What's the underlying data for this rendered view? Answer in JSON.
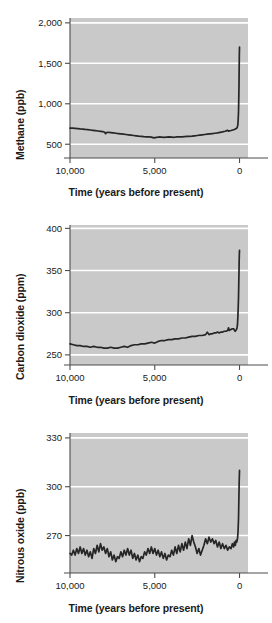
{
  "figure": {
    "title": "",
    "background_color": "#ffffff",
    "plot_background_color": "#c9c9c9",
    "gridline_color": "#ffffff",
    "line_color": "#262626",
    "axis_color": "#4d4d4d",
    "text_color": "#1a1a1a"
  },
  "panels": [
    {
      "id": "methane",
      "ylabel": "Methane (ppb)",
      "xlabel": "Time (years before present)",
      "yticks": [
        "2,000",
        "1,500",
        "1,000",
        "500"
      ],
      "ytick_values": [
        2000,
        1500,
        1000,
        500
      ],
      "xticks": [
        "10,000",
        "5,000",
        "0"
      ],
      "xtick_values": [
        10000,
        5000,
        0
      ]
    },
    {
      "id": "carbon-dioxide",
      "ylabel": "Carbon dioxide (ppm)",
      "xlabel": "Time (years before present)",
      "yticks": [
        "400",
        "350",
        "300",
        "250"
      ],
      "ytick_values": [
        400,
        350,
        300,
        250
      ],
      "xticks": [
        "10,000",
        "5,000",
        "0"
      ],
      "xtick_values": [
        10000,
        5000,
        0
      ]
    },
    {
      "id": "nitrous-oxide",
      "ylabel": "Nitrous oxide (ppb)",
      "xlabel": "Time (years before present)",
      "yticks": [
        "330",
        "300",
        "270"
      ],
      "ytick_values": [
        330,
        300,
        270
      ],
      "xticks": [
        "10,000",
        "5,000",
        "0"
      ],
      "xtick_values": [
        10000,
        5000,
        0
      ]
    }
  ],
  "chart_data": [
    {
      "type": "line",
      "id": "methane",
      "title": "",
      "xlabel": "Time (years before present)",
      "ylabel": "Methane (ppb)",
      "xlim": [
        10000,
        -500
      ],
      "ylim": [
        330,
        2060
      ],
      "xticks": [
        10000,
        5000,
        0
      ],
      "xticklabels": [
        "10,000",
        "5,000",
        "0"
      ],
      "yticks": [
        500,
        1000,
        1500,
        2000
      ],
      "yticklabels": [
        "500",
        "1,000",
        "1,500",
        "2,000"
      ],
      "x_reversed": true,
      "grid": "horizontal-white",
      "legend": "none",
      "series": [
        {
          "name": "Methane concentration",
          "units": "ppb",
          "x": [
            10000,
            9850,
            9700,
            9550,
            9400,
            9250,
            9100,
            8950,
            8800,
            8650,
            8500,
            8350,
            8200,
            8050,
            7950,
            7900,
            7850,
            7750,
            7600,
            7450,
            7300,
            7150,
            7000,
            6850,
            6700,
            6550,
            6400,
            6250,
            6100,
            5950,
            5800,
            5650,
            5500,
            5350,
            5200,
            5050,
            4900,
            4750,
            4600,
            4450,
            4300,
            4150,
            4000,
            3850,
            3700,
            3550,
            3400,
            3250,
            3100,
            2950,
            2800,
            2650,
            2500,
            2350,
            2200,
            2050,
            1900,
            1750,
            1600,
            1450,
            1300,
            1150,
            1000,
            850,
            750,
            700,
            650,
            600,
            500,
            400,
            300,
            250,
            200,
            160,
            130,
            100,
            80,
            60,
            45,
            30,
            20,
            10,
            0
          ],
          "y": [
            700,
            700,
            697,
            694,
            690,
            687,
            683,
            680,
            676,
            672,
            668,
            664,
            660,
            655,
            648,
            630,
            645,
            648,
            644,
            640,
            636,
            632,
            628,
            624,
            620,
            616,
            612,
            608,
            604,
            600,
            597,
            594,
            592,
            590,
            588,
            578,
            584,
            590,
            588,
            586,
            588,
            590,
            588,
            586,
            590,
            592,
            590,
            594,
            596,
            598,
            600,
            604,
            608,
            612,
            616,
            620,
            624,
            628,
            632,
            636,
            640,
            646,
            652,
            660,
            668,
            672,
            662,
            666,
            670,
            676,
            682,
            688,
            694,
            700,
            712,
            740,
            800,
            900,
            1050,
            1250,
            1450,
            1620,
            1700,
            1745
          ]
        }
      ]
    },
    {
      "type": "line",
      "id": "carbon-dioxide",
      "title": "",
      "xlabel": "Time (years before present)",
      "ylabel": "Carbon dioxide (ppm)",
      "xlim": [
        10000,
        -500
      ],
      "ylim": [
        238,
        404
      ],
      "xticks": [
        10000,
        5000,
        0
      ],
      "xticklabels": [
        "10,000",
        "5,000",
        "0"
      ],
      "yticks": [
        250,
        300,
        350,
        400
      ],
      "yticklabels": [
        "250",
        "300",
        "350",
        "400"
      ],
      "x_reversed": true,
      "grid": "horizontal-white",
      "legend": "none",
      "series": [
        {
          "name": "Carbon dioxide concentration",
          "units": "ppm",
          "x": [
            10000,
            9800,
            9600,
            9400,
            9200,
            9000,
            8800,
            8600,
            8400,
            8200,
            8000,
            7800,
            7600,
            7400,
            7200,
            7000,
            6800,
            6600,
            6400,
            6200,
            6000,
            5800,
            5600,
            5400,
            5200,
            5000,
            4800,
            4600,
            4400,
            4200,
            4000,
            3800,
            3600,
            3400,
            3200,
            3000,
            2800,
            2600,
            2400,
            2200,
            2000,
            1900,
            1800,
            1700,
            1600,
            1500,
            1400,
            1300,
            1200,
            1100,
            1000,
            900,
            800,
            700,
            650,
            600,
            550,
            500,
            420,
            350,
            300,
            260,
            220,
            180,
            150,
            120,
            100,
            80,
            60,
            45,
            30,
            20,
            10,
            0
          ],
          "y": [
            263,
            262,
            261,
            261,
            260,
            260,
            259,
            260,
            259,
            259,
            258,
            258,
            259,
            258,
            258,
            259,
            260,
            259,
            261,
            262,
            262,
            263,
            263,
            264,
            265,
            264,
            266,
            267,
            267,
            268,
            268,
            269,
            269,
            270,
            270,
            271,
            272,
            272,
            273,
            273,
            274,
            277,
            274,
            275,
            275,
            276,
            276,
            277,
            276,
            277,
            277,
            278,
            278,
            279,
            282,
            279,
            280,
            280,
            281,
            281,
            279,
            278,
            279,
            280,
            282,
            286,
            294,
            305,
            318,
            334,
            350,
            362,
            370,
            374
          ]
        }
      ]
    },
    {
      "type": "line",
      "id": "nitrous-oxide",
      "title": "",
      "xlabel": "Time (years before present)",
      "ylabel": "Nitrous oxide (ppb)",
      "xlim": [
        10000,
        -500
      ],
      "ylim": [
        247,
        333
      ],
      "xticks": [
        10000,
        5000,
        0
      ],
      "xticklabels": [
        "10,000",
        "5,000",
        "0"
      ],
      "yticks": [
        270,
        300,
        330
      ],
      "yticklabels": [
        "270",
        "300",
        "330"
      ],
      "x_reversed": true,
      "grid": "horizontal-white",
      "legend": "none",
      "series": [
        {
          "name": "Nitrous oxide concentration",
          "units": "ppb",
          "x": [
            10000,
            9900,
            9800,
            9700,
            9600,
            9500,
            9400,
            9300,
            9200,
            9100,
            9000,
            8900,
            8800,
            8700,
            8600,
            8500,
            8400,
            8300,
            8200,
            8100,
            8000,
            7900,
            7800,
            7700,
            7600,
            7500,
            7400,
            7300,
            7200,
            7100,
            7000,
            6900,
            6800,
            6700,
            6600,
            6500,
            6400,
            6300,
            6200,
            6100,
            6000,
            5900,
            5800,
            5700,
            5600,
            5500,
            5400,
            5300,
            5200,
            5100,
            5000,
            4900,
            4800,
            4700,
            4600,
            4500,
            4400,
            4300,
            4200,
            4100,
            4000,
            3900,
            3800,
            3700,
            3600,
            3500,
            3400,
            3300,
            3200,
            3100,
            3000,
            2900,
            2800,
            2700,
            2600,
            2500,
            2400,
            2300,
            2200,
            2100,
            2000,
            1900,
            1800,
            1700,
            1600,
            1500,
            1400,
            1300,
            1200,
            1100,
            1000,
            900,
            800,
            700,
            600,
            500,
            420,
            350,
            300,
            250,
            200,
            160,
            120,
            90,
            60,
            40,
            20,
            0
          ],
          "y": [
            259,
            258,
            261,
            258,
            262,
            259,
            263,
            259,
            262,
            258,
            261,
            257,
            260,
            256,
            262,
            259,
            264,
            260,
            265,
            261,
            263,
            259,
            262,
            257,
            260,
            255,
            258,
            254,
            257,
            256,
            260,
            257,
            261,
            258,
            262,
            258,
            261,
            256,
            259,
            255,
            258,
            254,
            257,
            256,
            260,
            258,
            262,
            259,
            263,
            259,
            262,
            258,
            261,
            257,
            260,
            256,
            259,
            255,
            258,
            257,
            261,
            258,
            263,
            259,
            264,
            260,
            265,
            261,
            266,
            262,
            268,
            264,
            270,
            266,
            263,
            259,
            262,
            258,
            261,
            264,
            268,
            265,
            269,
            266,
            268,
            265,
            267,
            263,
            266,
            262,
            265,
            262,
            264,
            261,
            263,
            262,
            265,
            263,
            266,
            264,
            267,
            266,
            268,
            272,
            280,
            292,
            303,
            310,
            314,
            316
          ]
        }
      ]
    }
  ]
}
